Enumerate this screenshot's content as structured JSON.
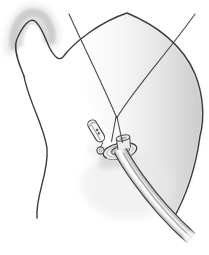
{
  "figure": {
    "kind": "surgical-line-illustration",
    "background": "#ffffff"
  },
  "palette": {
    "background": "#ffffff",
    "outline": "#3b3b3b",
    "suture": "#4a4a4a",
    "shade_soft": "#c6c6c6",
    "shade_mid": "#d8d8d8",
    "shade_light": "#e8e8e8",
    "tube_dark": "#474747",
    "tube_mid": "#c6c6c6",
    "tube_light": "#e9e9e9",
    "tube_highlight": "#ffffff",
    "tube_innershade": "#9c9c9c",
    "flange_fill": "#ededed",
    "flange_hole": "#c4c4c4",
    "flange_rim": "#aaaaaa",
    "pin_fill": "#f7f7f7",
    "pin_mark": "#585858",
    "shadow": "#c9c9c9"
  },
  "elements": {
    "shoulder_shading": "shaded shoulder mass",
    "body_outline": "torso and shoulder outline",
    "left_body_line": "left body edge line",
    "body_dome_shading": "shaded body dome",
    "suture_left": "left suture thread",
    "suture_right": "right suture thread",
    "suture_knot": "suture knot",
    "suture_tie_v": "suture tie around tube neck",
    "retention_flange": "round retention flange at skin exit",
    "tube_neck": "tube opening above flange",
    "safety_pin": "safety pin",
    "pin_ring": "attachment ring",
    "drainage_tube": "curved drainage tube",
    "flange_shadow": "shadow under flange"
  }
}
